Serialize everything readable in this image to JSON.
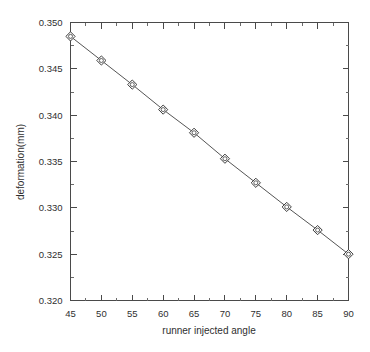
{
  "chart_data": {
    "type": "line",
    "title": "",
    "xlabel": "runner injected angle",
    "ylabel": "deformation(mm)",
    "x": [
      45,
      50,
      55,
      60,
      65,
      70,
      75,
      80,
      85,
      90
    ],
    "values": [
      0.3485,
      0.3459,
      0.3433,
      0.3406,
      0.3381,
      0.3353,
      0.3327,
      0.3301,
      0.3276,
      0.325
    ],
    "series": [
      {
        "name": "deformation",
        "values": [
          0.3485,
          0.3459,
          0.3433,
          0.3406,
          0.3381,
          0.3353,
          0.3327,
          0.3301,
          0.3276,
          0.325
        ]
      }
    ],
    "xlim": [
      45,
      90
    ],
    "ylim": [
      0.32,
      0.35
    ],
    "xticks": [
      45,
      50,
      55,
      60,
      65,
      70,
      75,
      80,
      85,
      90
    ],
    "xtick_labels": [
      "45",
      "50",
      "55",
      "60",
      "65",
      "70",
      "75",
      "80",
      "85",
      "90"
    ],
    "yticks": [
      0.32,
      0.325,
      0.33,
      0.335,
      0.34,
      0.345,
      0.35
    ],
    "ytick_labels": [
      "0.320",
      "0.325",
      "0.330",
      "0.335",
      "0.340",
      "0.345",
      "0.350"
    ],
    "x_minor_interval": 2.5,
    "y_minor_interval": 0.0025,
    "grid": false,
    "legend": "none",
    "marker": "diamond-with-dot",
    "line_color": "#555555",
    "marker_edge_color": "#3d3d3d",
    "marker_face_color": "#ffffff",
    "axis_color": "#4a4a4a",
    "background_color": "#ffffff",
    "frame": "box"
  }
}
